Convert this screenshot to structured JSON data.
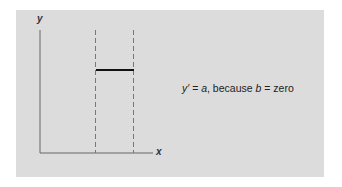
{
  "diagram": {
    "axes": {
      "x_label": "x",
      "y_label": "y"
    },
    "equation": {
      "lhs": "y′",
      "eq1": " = ",
      "a": "a",
      "middle": ", because ",
      "b": "b",
      "eq2": " = ",
      "rhs": "zero"
    },
    "elements": [
      {
        "type": "dashed-vertical-line",
        "position": "left"
      },
      {
        "type": "dashed-vertical-line",
        "position": "right"
      },
      {
        "type": "horizontal-segment",
        "description": "constant y between dashed lines"
      }
    ],
    "colors": {
      "panel": "#dcdcdc",
      "lines": "#555555",
      "segment": "#111111"
    }
  }
}
